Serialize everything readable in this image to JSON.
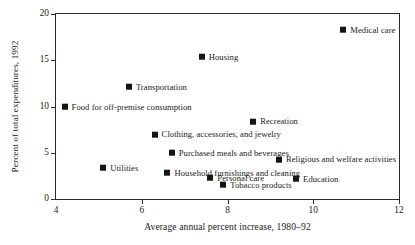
{
  "chart_data": {
    "type": "scatter",
    "title": "",
    "xlabel": "Average annual percent increase, 1980–92",
    "ylabel": "Percent of total expenditures, 1992",
    "xlim": [
      4,
      12
    ],
    "ylim": [
      0,
      20
    ],
    "xticks": [
      4,
      6,
      8,
      10,
      12
    ],
    "yticks": [
      0,
      5,
      10,
      15,
      20
    ],
    "xtick_labels": [
      "4",
      "6",
      "8",
      "10",
      "12"
    ],
    "ytick_labels": [
      "0",
      "5",
      "10",
      "15",
      "20"
    ],
    "grid": false,
    "legend": "none (points labeled inline)",
    "label_position": "right of marker",
    "points": [
      {
        "label": "Medical care",
        "x": 10.7,
        "y": 18.3
      },
      {
        "label": "Housing",
        "x": 7.4,
        "y": 15.4
      },
      {
        "label": "Transportation",
        "x": 5.7,
        "y": 12.1
      },
      {
        "label": "Food for off-premise consumption",
        "x": 4.2,
        "y": 10.0
      },
      {
        "label": "Recreation",
        "x": 8.6,
        "y": 8.4
      },
      {
        "label": "Clothing, accessories, and jewelry",
        "x": 6.3,
        "y": 7.0
      },
      {
        "label": "Purchased meals and beverages",
        "x": 6.7,
        "y": 5.0
      },
      {
        "label": "Religious and welfare activities",
        "x": 9.2,
        "y": 4.3
      },
      {
        "label": "Utilities",
        "x": 5.1,
        "y": 3.4
      },
      {
        "label": "Household furnishings and cleaning",
        "x": 6.6,
        "y": 2.8
      },
      {
        "label": "Personal care",
        "x": 7.6,
        "y": 2.3
      },
      {
        "label": "Education",
        "x": 9.6,
        "y": 2.2
      },
      {
        "label": "Tobacco products",
        "x": 7.9,
        "y": 1.5
      }
    ]
  }
}
